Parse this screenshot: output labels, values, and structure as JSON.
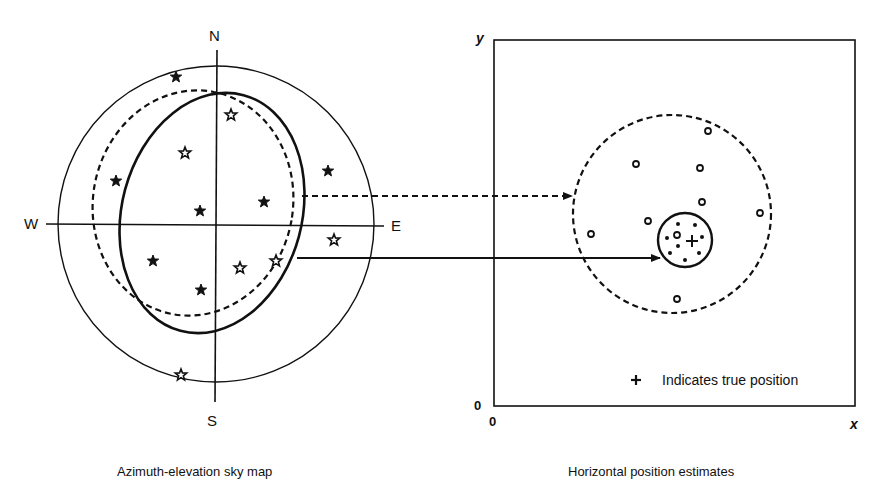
{
  "left_panel": {
    "caption": "Azimuth-elevation sky map",
    "compass": {
      "north": "N",
      "south": "S",
      "west": "W",
      "east": "E"
    },
    "outer_circle": {
      "cx": 216,
      "cy": 224,
      "r": 158
    },
    "solid_ellipse": {
      "cx": 212,
      "cy": 213,
      "rx": 90,
      "ry": 122,
      "rotate": 15
    },
    "dashed_ellipse": {
      "cx": 193,
      "cy": 203,
      "rx": 100,
      "ry": 113,
      "rotate": 10
    },
    "satellites": [
      {
        "x": 176,
        "y": 77,
        "filled": true
      },
      {
        "x": 231,
        "y": 115,
        "filled": false
      },
      {
        "x": 185,
        "y": 153,
        "filled": false
      },
      {
        "x": 116,
        "y": 181,
        "filled": true
      },
      {
        "x": 328,
        "y": 171,
        "filled": true
      },
      {
        "x": 264,
        "y": 202,
        "filled": true
      },
      {
        "x": 200,
        "y": 211,
        "filled": true
      },
      {
        "x": 334,
        "y": 240,
        "filled": false
      },
      {
        "x": 153,
        "y": 261,
        "filled": true
      },
      {
        "x": 240,
        "y": 268,
        "filled": false
      },
      {
        "x": 276,
        "y": 261,
        "filled": false
      },
      {
        "x": 201,
        "y": 290,
        "filled": true
      },
      {
        "x": 181,
        "y": 375,
        "filled": false
      }
    ]
  },
  "right_panel": {
    "caption": "Horizontal position estimates",
    "x_axis_label": "x",
    "y_axis_label": "y",
    "origin_x_label": "0",
    "origin_y_label": "0",
    "legend": {
      "symbol": "+",
      "text": "Indicates true position"
    },
    "true_position": {
      "x": 692,
      "y": 241
    },
    "dashed_circle": {
      "cx": 672,
      "cy": 214,
      "r": 99
    },
    "solid_circle": {
      "cx": 685,
      "cy": 240,
      "r": 27
    },
    "open_estimates": [
      {
        "x": 708,
        "y": 131
      },
      {
        "x": 636,
        "y": 164
      },
      {
        "x": 700,
        "y": 168
      },
      {
        "x": 702,
        "y": 202
      },
      {
        "x": 760,
        "y": 213
      },
      {
        "x": 648,
        "y": 221
      },
      {
        "x": 591,
        "y": 234
      },
      {
        "x": 677,
        "y": 235
      },
      {
        "x": 677,
        "y": 299
      }
    ],
    "filled_estimates": [
      {
        "x": 678,
        "y": 224
      },
      {
        "x": 695,
        "y": 225
      },
      {
        "x": 667,
        "y": 238
      },
      {
        "x": 702,
        "y": 237
      },
      {
        "x": 678,
        "y": 246
      },
      {
        "x": 670,
        "y": 253
      },
      {
        "x": 699,
        "y": 253
      },
      {
        "x": 685,
        "y": 260
      }
    ]
  },
  "arrows": [
    {
      "style": "dashed",
      "from": [
        302,
        196
      ],
      "to": [
        572,
        196
      ],
      "meaning": "dashed-ellipse-to-dashed-circle"
    },
    {
      "style": "solid",
      "from": [
        297,
        258
      ],
      "to": [
        660,
        258
      ],
      "meaning": "solid-ellipse-to-solid-circle"
    }
  ]
}
